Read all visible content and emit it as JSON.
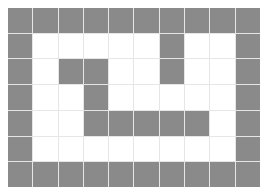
{
  "grid": {
    "rows": 7,
    "cols": 10,
    "colors": {
      "wall": "#8a8a8a",
      "empty": "#ffffff",
      "gridline": "#e6e6e6"
    },
    "cells": [
      [
        1,
        1,
        1,
        1,
        1,
        1,
        1,
        1,
        1,
        1
      ],
      [
        1,
        0,
        0,
        0,
        0,
        0,
        1,
        0,
        0,
        1
      ],
      [
        1,
        0,
        1,
        1,
        0,
        0,
        1,
        0,
        0,
        1
      ],
      [
        1,
        0,
        0,
        1,
        0,
        0,
        0,
        0,
        0,
        1
      ],
      [
        1,
        0,
        0,
        1,
        1,
        1,
        1,
        1,
        0,
        1
      ],
      [
        1,
        0,
        0,
        0,
        0,
        0,
        0,
        0,
        0,
        1
      ],
      [
        1,
        1,
        1,
        1,
        1,
        1,
        1,
        1,
        1,
        1
      ]
    ]
  }
}
